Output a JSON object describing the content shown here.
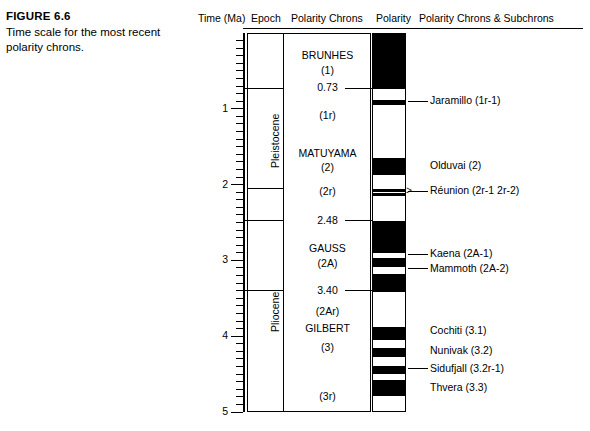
{
  "caption": {
    "figure_number": "FIGURE 6.6",
    "text": "Time scale for the most recent polarity chrons."
  },
  "headers": {
    "time": "Time (Ma)",
    "epoch": "Epoch",
    "polarity_chrons": "Polarity Chrons",
    "polarity": "Polarity",
    "subchrons": "Polarity Chrons & Subchrons"
  },
  "axis": {
    "unit": "Ma",
    "min": 0,
    "max": 5,
    "tick_labels": [
      "1",
      "2",
      "3",
      "4",
      "5"
    ],
    "tick_values": [
      1,
      2,
      3,
      4,
      5
    ],
    "minor_interval": 0.1
  },
  "epochs": [
    {
      "name": "Pleistocene",
      "top": 0,
      "bottom": 2.04
    },
    {
      "name": "Pliocene",
      "top": 2.04,
      "bottom": 5.0
    }
  ],
  "chrons": [
    {
      "label": "BRUNHES",
      "age": 0.3
    },
    {
      "label": "(1)",
      "age": 0.5
    },
    {
      "label": "0.73",
      "age": 0.73,
      "is_boundary": true
    },
    {
      "label": "(1r)",
      "age": 1.1
    },
    {
      "label": "MATUYAMA",
      "age": 1.6
    },
    {
      "label": "(2)",
      "age": 1.78
    },
    {
      "label": "(2r)",
      "age": 2.1
    },
    {
      "label": "2.48",
      "age": 2.48,
      "is_boundary": true
    },
    {
      "label": "GAUSS",
      "age": 2.85
    },
    {
      "label": "(2A)",
      "age": 3.05
    },
    {
      "label": "3.40",
      "age": 3.4,
      "is_boundary": true
    },
    {
      "label": "(2Ar)",
      "age": 3.68
    },
    {
      "label": "GILBERT",
      "age": 3.9
    },
    {
      "label": "(3)",
      "age": 4.15
    },
    {
      "label": "(3r)",
      "age": 4.8
    }
  ],
  "polarity_bands": [
    {
      "name": "brunhes-normal",
      "top": 0.0,
      "bottom": 0.73,
      "polarity": "normal"
    },
    {
      "name": "jaramillo",
      "top": 0.87,
      "bottom": 0.94,
      "polarity": "normal"
    },
    {
      "name": "olduvai",
      "top": 1.64,
      "bottom": 1.86,
      "polarity": "normal"
    },
    {
      "name": "reunion-2r-1",
      "top": 2.04,
      "bottom": 2.08,
      "polarity": "normal"
    },
    {
      "name": "reunion-2r-2",
      "top": 2.1,
      "bottom": 2.14,
      "polarity": "normal"
    },
    {
      "name": "gauss-normal-a",
      "top": 2.47,
      "bottom": 2.89,
      "polarity": "normal"
    },
    {
      "name": "gauss-normal-b",
      "top": 2.96,
      "bottom": 3.07,
      "polarity": "normal"
    },
    {
      "name": "gauss-normal-c",
      "top": 3.16,
      "bottom": 3.4,
      "polarity": "normal"
    },
    {
      "name": "cochiti",
      "top": 3.86,
      "bottom": 4.04,
      "polarity": "normal"
    },
    {
      "name": "nunivak",
      "top": 4.14,
      "bottom": 4.26,
      "polarity": "normal"
    },
    {
      "name": "sidufjall",
      "top": 4.38,
      "bottom": 4.48,
      "polarity": "normal"
    },
    {
      "name": "thvera",
      "top": 4.57,
      "bottom": 4.77,
      "polarity": "normal"
    }
  ],
  "annotations": [
    {
      "label": "Jaramillo (1r-1)",
      "age": 0.9,
      "leader": true,
      "arrow": false
    },
    {
      "label": "Olduvai (2)",
      "age": 1.75,
      "leader": false,
      "arrow": false
    },
    {
      "label": "Réunion (2r-1 2r-2)",
      "age": 2.09,
      "leader": true,
      "arrow": true
    },
    {
      "label": "Kaena (2A-1)",
      "age": 2.92,
      "leader": true,
      "arrow": false
    },
    {
      "label": "Mammoth (2A-2)",
      "age": 3.11,
      "leader": true,
      "arrow": false
    },
    {
      "label": "Cochiti (3.1)",
      "age": 3.93,
      "leader": false,
      "arrow": false
    },
    {
      "label": "Nunivak (3.2)",
      "age": 4.2,
      "leader": false,
      "arrow": false
    },
    {
      "label": "Sidufjall (3.2r-1)",
      "age": 4.43,
      "leader": true,
      "arrow": false
    },
    {
      "label": "Thvera (3.3)",
      "age": 4.68,
      "leader": false,
      "arrow": false
    }
  ],
  "colors": {
    "normal_polarity": "#000000",
    "reversed_polarity": "#ffffff",
    "rule": "#000000"
  }
}
